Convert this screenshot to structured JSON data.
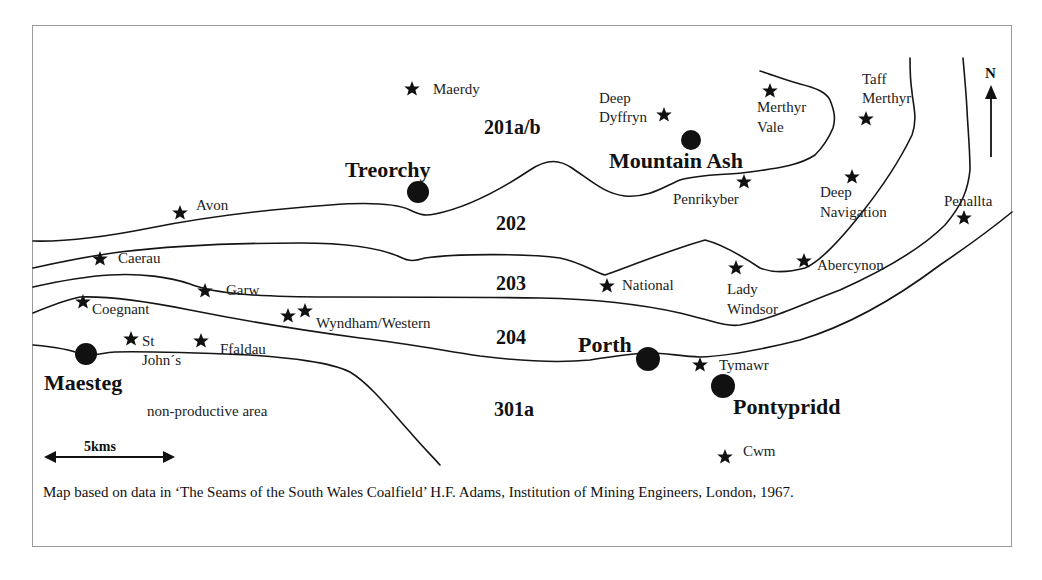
{
  "map": {
    "caption": "Map based on  data in ‘The Seams of the South Wales Coalfield’ H.F. Adams, Institution of Mining Engineers, London, 1967.",
    "north_label": "N",
    "scale_label": "5kms",
    "area_label": "non-productive area",
    "towns": [
      {
        "name": "Treorchy"
      },
      {
        "name": "Mountain Ash"
      },
      {
        "name": "Maesteg"
      },
      {
        "name": "Porth"
      },
      {
        "name": "Pontypridd"
      }
    ],
    "seams": [
      {
        "label": "201a/b"
      },
      {
        "label": "202"
      },
      {
        "label": "203"
      },
      {
        "label": "204"
      },
      {
        "label": "301a"
      }
    ],
    "collieries": [
      {
        "lines": [
          "Maerdy"
        ]
      },
      {
        "lines": [
          "Deep",
          "Dyffryn"
        ]
      },
      {
        "lines": [
          "Merthyr",
          "Vale"
        ]
      },
      {
        "lines": [
          "Taff",
          "Merthyr"
        ]
      },
      {
        "lines": [
          "Penrikyber"
        ]
      },
      {
        "lines": [
          "Deep",
          "Navigation"
        ]
      },
      {
        "lines": [
          "Penallta"
        ]
      },
      {
        "lines": [
          "Avon"
        ]
      },
      {
        "lines": [
          "Caerau"
        ]
      },
      {
        "lines": [
          "Garw"
        ]
      },
      {
        "lines": [
          "National"
        ]
      },
      {
        "lines": [
          "Lady",
          "Windsor"
        ]
      },
      {
        "lines": [
          "Abercynon"
        ]
      },
      {
        "lines": [
          "Coegnant"
        ]
      },
      {
        "lines": [
          "Wyndham/Western"
        ]
      },
      {
        "lines": [
          "St",
          "John´s"
        ]
      },
      {
        "lines": [
          "Ffaldau"
        ]
      },
      {
        "lines": [
          "Tymawr"
        ]
      },
      {
        "lines": [
          "Cwm"
        ]
      }
    ]
  }
}
